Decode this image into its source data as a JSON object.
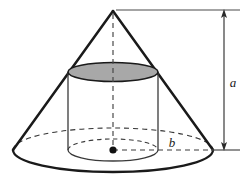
{
  "figure": {
    "kind": "geometry-diagram",
    "background_color": "#ffffff",
    "stroke_color": "#1a1a1a",
    "thin_stroke_color": "#333333",
    "cylinder_top_fill": "#a8a8a8",
    "labels": {
      "height_label": "a",
      "radius_label": "b"
    },
    "geometry": {
      "apex": {
        "x": 113,
        "y": 10
      },
      "base_center": {
        "x": 113,
        "y": 150
      },
      "cone_base_rx": 100,
      "cone_base_ry": 22,
      "cylinder_top_center": {
        "x": 113,
        "y": 72
      },
      "cylinder_rx": 45,
      "cylinder_ry": 9.5,
      "cylinder_bottom_center": {
        "x": 113,
        "y": 150
      },
      "cylinder_bottom_ry": 11,
      "dimension_line_x": 224,
      "dimension_top_y": 10,
      "dimension_bottom_y": 150
    },
    "elements": {
      "apex_name": "cone-apex",
      "center_dot_name": "base-center-dot",
      "height_dimension_name": "height-dimension-a",
      "radius_dimension_name": "radius-dimension-b"
    }
  }
}
